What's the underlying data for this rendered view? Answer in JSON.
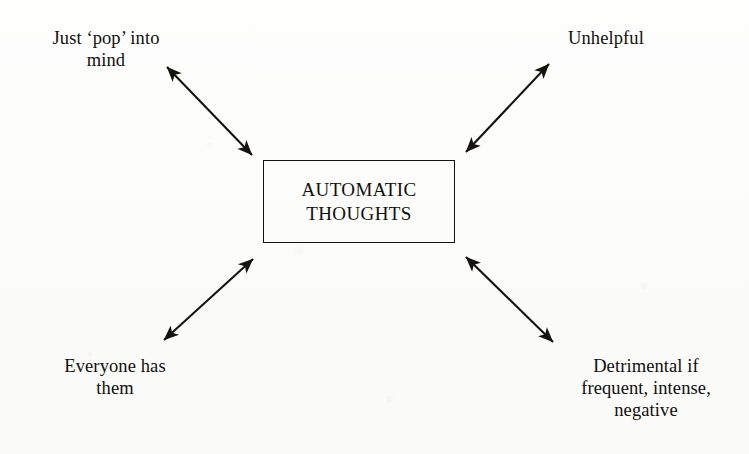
{
  "diagram": {
    "type": "radial-concept-map",
    "center": {
      "text": "AUTOMATIC\nTHOUGHTS",
      "shape": "rectangle"
    },
    "nodes": [
      {
        "id": "pop-into-mind",
        "text": "Just ‘pop’ into\nmind",
        "position": "top-left"
      },
      {
        "id": "unhelpful",
        "text": "Unhelpful",
        "position": "top-right"
      },
      {
        "id": "everyone-has-them",
        "text": "Everyone has\nthem",
        "position": "bottom-left"
      },
      {
        "id": "detrimental",
        "text": "Detrimental if\nfrequent, intense,\nnegative",
        "position": "bottom-right"
      }
    ],
    "connectors": [
      {
        "id": "connector-top-left",
        "style": "double-headed-arrow",
        "from": "center",
        "to": "pop-into-mind"
      },
      {
        "id": "connector-top-right",
        "style": "double-headed-arrow",
        "from": "center",
        "to": "unhelpful"
      },
      {
        "id": "connector-bottom-left",
        "style": "double-headed-arrow",
        "from": "center",
        "to": "everyone-has-them"
      },
      {
        "id": "connector-bottom-right",
        "style": "double-headed-arrow",
        "from": "center",
        "to": "detrimental"
      }
    ],
    "colors": {
      "ink": "#14130f",
      "paper": "#fdfdfc"
    }
  }
}
